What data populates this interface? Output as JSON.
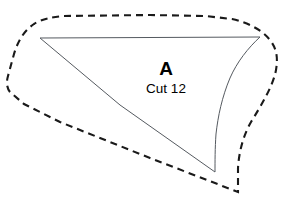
{
  "sheet": {
    "background_color": "#ffffff",
    "width": 289,
    "height": 200
  },
  "pattern_piece": {
    "label": "A",
    "cut_instruction": "Cut 12",
    "label_x": 166,
    "label_y": 75,
    "sublabel_x": 166,
    "sublabel_y": 93
  },
  "lines": {
    "cutting_line": {
      "name": "cutting-line",
      "style": "dashed",
      "color": "#1a1a1a",
      "width": 2.1,
      "dash_pattern": "7 5",
      "path": "M 64,16 L 150,15 L 205,16 L 232,19 C 249,23 262,30 270,40 C 277,49 278,58 276,70 C 273,86 262,104 251,122 C 243,136 239,152 238,168 L 238,192 L 150,158 L 60,122 L 24,104 L 10,92 C 7,88 6,83 8,76 L 14,54 C 18,40 25,30 34,24 C 42,19 52,17 64,16 Z"
    },
    "sewing_line": {
      "name": "sewing-line",
      "style": "solid",
      "color": "#555a60",
      "width": 1,
      "path": "M 40,38 L 260,37 C 248,48 237,62 230,78 C 222,97 218,116 216,134 C 215,148 215,162 215,172 L 120,105 Z"
    }
  }
}
